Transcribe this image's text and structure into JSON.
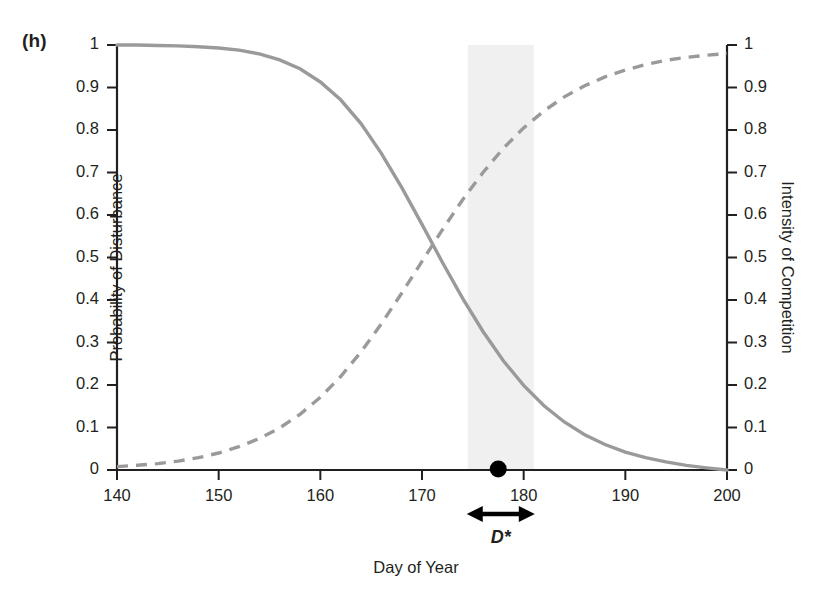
{
  "panel": {
    "label": "(h)"
  },
  "axes": {
    "x": {
      "title": "Day of Year",
      "min": 140,
      "max": 200,
      "ticks": [
        140,
        150,
        160,
        170,
        180,
        190,
        200
      ],
      "tick_labels": [
        "140",
        "150",
        "160",
        "170",
        "180",
        "190",
        "200"
      ]
    },
    "y_left": {
      "title": "Probability of Disturbance",
      "min": 0,
      "max": 1,
      "ticks": [
        0,
        0.1,
        0.2,
        0.3,
        0.4,
        0.5,
        0.6,
        0.7,
        0.8,
        0.9,
        1
      ],
      "tick_labels": [
        "0",
        "0.1",
        "0.2",
        "0.3",
        "0.4",
        "0.5",
        "0.6",
        "0.7",
        "0.8",
        "0.9",
        "1"
      ]
    },
    "y_right": {
      "title": "Intensity of Competition",
      "min": 0,
      "max": 1,
      "ticks": [
        0,
        0.1,
        0.2,
        0.3,
        0.4,
        0.5,
        0.6,
        0.7,
        0.8,
        0.9,
        1
      ],
      "tick_labels": [
        "0",
        "0.1",
        "0.2",
        "0.3",
        "0.4",
        "0.5",
        "0.6",
        "0.7",
        "0.8",
        "0.9",
        "1"
      ]
    }
  },
  "annotations": {
    "dstar_label": "D*",
    "dstar_range": [
      174.5,
      181.0
    ],
    "optimum_day": 177.5,
    "band_color": "#f0f0f0"
  },
  "colors": {
    "curve": "#9a9a9a",
    "axis": "#231f20",
    "text": "#231f20",
    "marker": "#000000",
    "band": "#f0f0f0"
  },
  "chart_data": {
    "type": "line",
    "title": "",
    "subtitle": "",
    "xlabel": "Day of Year",
    "ylabel": "Probability of Disturbance",
    "ylabel_right": "Intensity of Competition",
    "xlim": [
      140,
      200
    ],
    "ylim": [
      0,
      1
    ],
    "ylim_right": [
      0,
      1
    ],
    "grid": false,
    "legend": "none",
    "x": [
      140,
      142,
      144,
      146,
      148,
      150,
      152,
      154,
      156,
      158,
      160,
      162,
      164,
      166,
      168,
      170,
      172,
      174,
      176,
      178,
      180,
      182,
      184,
      186,
      188,
      190,
      192,
      194,
      196,
      198,
      200
    ],
    "series": [
      {
        "name": "Probability of Disturbance",
        "axis": "left",
        "style": "solid",
        "color": "#9a9a9a",
        "values": [
          1.0,
          1.0,
          0.999,
          0.998,
          0.996,
          0.993,
          0.988,
          0.979,
          0.965,
          0.944,
          0.913,
          0.871,
          0.815,
          0.745,
          0.665,
          0.578,
          0.489,
          0.404,
          0.326,
          0.257,
          0.199,
          0.151,
          0.113,
          0.083,
          0.06,
          0.042,
          0.029,
          0.019,
          0.011,
          0.005,
          0.0
        ]
      },
      {
        "name": "Intensity of Competition",
        "axis": "right",
        "style": "dashed",
        "color": "#9a9a9a",
        "values": [
          0.008,
          0.011,
          0.015,
          0.021,
          0.029,
          0.04,
          0.055,
          0.074,
          0.099,
          0.131,
          0.171,
          0.22,
          0.278,
          0.344,
          0.416,
          0.491,
          0.565,
          0.636,
          0.7,
          0.757,
          0.805,
          0.845,
          0.878,
          0.904,
          0.925,
          0.941,
          0.954,
          0.964,
          0.971,
          0.976,
          0.98
        ]
      }
    ],
    "markers": [
      {
        "name": "optimum-point",
        "x": 177.5,
        "y": 0,
        "shape": "circle",
        "color": "#000000"
      }
    ],
    "shaded_bands": [
      {
        "name": "dstar-band",
        "x0": 174.5,
        "x1": 181.0,
        "color": "#f0f0f0"
      }
    ],
    "annotations": [
      {
        "name": "dstar-arrow",
        "text": "D*",
        "x0": 174.5,
        "x1": 181.0,
        "type": "double-arrow"
      }
    ]
  }
}
